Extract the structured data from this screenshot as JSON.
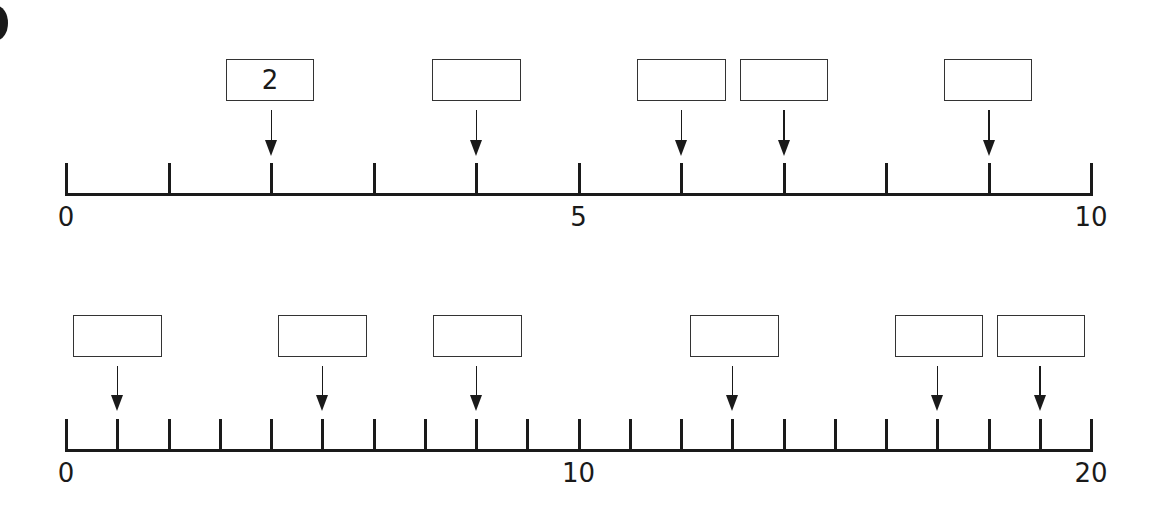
{
  "chart_data": [
    {
      "type": "number_line",
      "min": 0,
      "max": 10,
      "tick_step": 1,
      "tick_labels": [
        "0",
        "5",
        "10"
      ],
      "labeled_ticks": [
        0,
        5,
        10
      ],
      "arrows_at": [
        2,
        4,
        6,
        7,
        9
      ],
      "boxes": [
        {
          "points_to": 2,
          "text": "2"
        },
        {
          "points_to": 4,
          "text": ""
        },
        {
          "points_to": 6,
          "text": ""
        },
        {
          "points_to": 7,
          "text": ""
        },
        {
          "points_to": 9,
          "text": ""
        }
      ]
    },
    {
      "type": "number_line",
      "min": 0,
      "max": 20,
      "tick_step": 1,
      "tick_labels": [
        "0",
        "10",
        "20"
      ],
      "labeled_ticks": [
        0,
        10,
        20
      ],
      "arrows_at": [
        1,
        5,
        8,
        13,
        17,
        19
      ],
      "boxes": [
        {
          "points_to": 1,
          "text": ""
        },
        {
          "points_to": 5,
          "text": ""
        },
        {
          "points_to": 8,
          "text": ""
        },
        {
          "points_to": 13,
          "text": ""
        },
        {
          "points_to": 17,
          "text": ""
        },
        {
          "points_to": 19,
          "text": ""
        }
      ]
    }
  ],
  "lines": [
    {
      "axis_y": 193,
      "x0": 65,
      "x1": 1090,
      "tick_top": 163,
      "label_y": 204,
      "box_top": 59,
      "box_h": 42,
      "arrow_top": 110,
      "arrow_bottom": 156,
      "boxes": [
        {
          "x": 226,
          "w": 88,
          "value": 2,
          "text": "2"
        },
        {
          "x": 432,
          "w": 89,
          "value": 4,
          "text": ""
        },
        {
          "x": 637,
          "w": 89,
          "value": 6,
          "text": ""
        },
        {
          "x": 740,
          "w": 88,
          "value": 7,
          "text": ""
        },
        {
          "x": 944,
          "w": 88,
          "value": 9,
          "text": ""
        }
      ]
    },
    {
      "axis_y": 449,
      "x0": 65,
      "x1": 1090,
      "tick_top": 419,
      "label_y": 460,
      "box_top": 315,
      "box_h": 42,
      "arrow_top": 366,
      "arrow_bottom": 411,
      "boxes": [
        {
          "x": 73,
          "w": 89,
          "value": 1,
          "text": ""
        },
        {
          "x": 278,
          "w": 89,
          "value": 5,
          "text": ""
        },
        {
          "x": 433,
          "w": 89,
          "value": 8,
          "text": ""
        },
        {
          "x": 690,
          "w": 89,
          "value": 13,
          "text": ""
        },
        {
          "x": 895,
          "w": 88,
          "value": 17,
          "text": ""
        },
        {
          "x": 997,
          "w": 88,
          "value": 19,
          "text": ""
        }
      ]
    }
  ]
}
